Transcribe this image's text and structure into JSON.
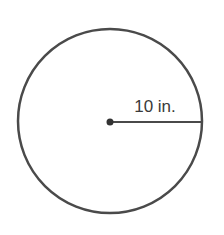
{
  "diagram": {
    "type": "circle-with-radius",
    "radius_label": "10 in.",
    "circle": {
      "cx": 110,
      "cy": 121,
      "r": 92,
      "stroke": "#4a4a4a",
      "stroke_width": 2.5,
      "fill": "#ffffff"
    },
    "center_point": {
      "cx": 110,
      "cy": 122,
      "r": 3.5,
      "fill": "#333333"
    },
    "radius_line": {
      "x1": 110,
      "y1": 122,
      "x2": 202,
      "y2": 122,
      "stroke": "#4a4a4a",
      "stroke_width": 2
    },
    "label_position": {
      "x": 155,
      "y": 112
    }
  }
}
